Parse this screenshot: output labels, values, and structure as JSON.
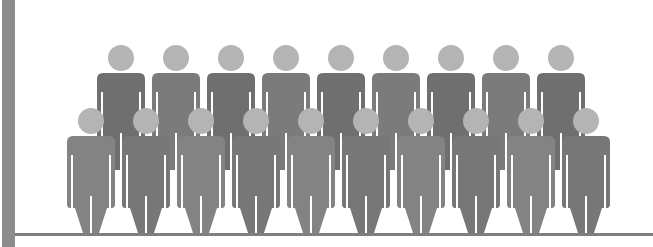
{
  "pictogram": {
    "description": "Crowd of person icons in two rows",
    "colors": {
      "background": "#ffffff",
      "head": "#b4b4b4",
      "back_body_dark": "#6f6f6f",
      "back_body_light": "#7b7b7b",
      "front_body_dark": "#777777",
      "front_body_light": "#838383",
      "axis": "#8c8c8c",
      "baseline": "#7f7f7f"
    },
    "back_row": {
      "count": 9,
      "head_y": 58,
      "centers_x": [
        121,
        176,
        231,
        286,
        341,
        396,
        451,
        506,
        561
      ]
    },
    "front_row": {
      "count": 10,
      "head_y": 121,
      "centers_x": [
        91,
        146,
        201,
        256,
        311,
        366,
        421,
        476,
        531,
        586
      ]
    },
    "total_figures": 19
  }
}
